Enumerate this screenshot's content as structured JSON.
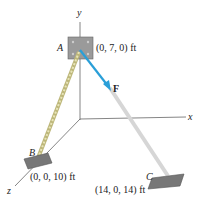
{
  "figure": {
    "axes": {
      "x": "x",
      "y": "y",
      "z": "z"
    },
    "points": {
      "A": {
        "label": "A",
        "coords": "(0, 7, 0) ft"
      },
      "B": {
        "label": "B",
        "coords": "(0, 0, 10) ft"
      },
      "C": {
        "label": "C",
        "coords": "(14, 0, 14) ft"
      }
    },
    "force": {
      "label": "F",
      "color": "#2a9fd8"
    },
    "colors": {
      "rope": "#c9c48a",
      "cable": "#d8d8d8",
      "plate": "#8a8a8a",
      "axis": "#555555"
    }
  }
}
